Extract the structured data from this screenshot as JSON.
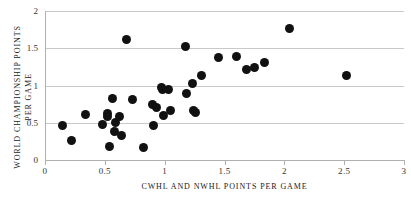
{
  "chart_data": {
    "type": "scatter",
    "title": "",
    "xlabel": "CWHL AND NWHL POINTS PER GAME",
    "ylabel": "WORLD CHAMPIONSHIP POINTS PER GAME",
    "xlim": [
      0,
      3
    ],
    "ylim": [
      0,
      2
    ],
    "xticks": [
      0,
      0.5,
      1,
      1.5,
      2,
      2.5,
      3
    ],
    "xtick_labels": [
      "0",
      "0.5",
      "1",
      "1.5",
      "2",
      "2.5",
      "3"
    ],
    "yticks": [
      0,
      0.5,
      1,
      1.5,
      2
    ],
    "ytick_labels": [
      "0",
      "0.5",
      "1",
      "1.5",
      "2"
    ],
    "grid": "horizontal",
    "legend": null,
    "marker_color": "#111111",
    "gridline_color": "#c9c9c9",
    "axis_color": "#b0b0b0",
    "background": "#ffffff",
    "points": [
      {
        "x": 0.15,
        "y": 0.46
      },
      {
        "x": 0.22,
        "y": 0.26
      },
      {
        "x": 0.34,
        "y": 0.61
      },
      {
        "x": 0.48,
        "y": 0.48
      },
      {
        "x": 0.52,
        "y": 0.62
      },
      {
        "x": 0.52,
        "y": 0.58
      },
      {
        "x": 0.54,
        "y": 0.18
      },
      {
        "x": 0.56,
        "y": 0.82
      },
      {
        "x": 0.58,
        "y": 0.38
      },
      {
        "x": 0.59,
        "y": 0.5
      },
      {
        "x": 0.62,
        "y": 0.59
      },
      {
        "x": 0.64,
        "y": 0.33
      },
      {
        "x": 0.68,
        "y": 1.62
      },
      {
        "x": 0.73,
        "y": 0.81
      },
      {
        "x": 0.82,
        "y": 0.17
      },
      {
        "x": 0.9,
        "y": 0.74
      },
      {
        "x": 0.91,
        "y": 0.46
      },
      {
        "x": 0.93,
        "y": 0.7
      },
      {
        "x": 0.97,
        "y": 0.98
      },
      {
        "x": 0.98,
        "y": 0.95
      },
      {
        "x": 0.99,
        "y": 0.6
      },
      {
        "x": 1.03,
        "y": 0.95
      },
      {
        "x": 1.05,
        "y": 0.66
      },
      {
        "x": 1.17,
        "y": 1.52
      },
      {
        "x": 1.18,
        "y": 0.89
      },
      {
        "x": 1.23,
        "y": 1.03
      },
      {
        "x": 1.24,
        "y": 0.67
      },
      {
        "x": 1.26,
        "y": 0.64
      },
      {
        "x": 1.31,
        "y": 1.14
      },
      {
        "x": 1.45,
        "y": 1.37
      },
      {
        "x": 1.6,
        "y": 1.39
      },
      {
        "x": 1.68,
        "y": 1.21
      },
      {
        "x": 1.75,
        "y": 1.24
      },
      {
        "x": 1.83,
        "y": 1.31
      },
      {
        "x": 2.04,
        "y": 1.76
      },
      {
        "x": 2.52,
        "y": 1.13
      }
    ]
  }
}
